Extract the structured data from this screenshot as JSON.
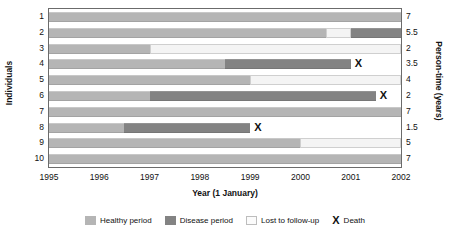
{
  "chart_data": {
    "type": "bar",
    "title": "",
    "xlabel": "Year (1 January)",
    "ylabel": "Individuals",
    "y2label": "Person-time (years)",
    "xlim": [
      1995,
      2002
    ],
    "xticks": [
      "1995",
      "1996",
      "1997",
      "1998",
      "1999",
      "2000",
      "2001",
      "2002"
    ],
    "categories": [
      "1",
      "2",
      "3",
      "4",
      "5",
      "6",
      "7",
      "8",
      "9",
      "10"
    ],
    "person_time": [
      "7",
      "5.5",
      "2",
      "3.5",
      "4",
      "2",
      "7",
      "1.5",
      "5",
      "7"
    ],
    "grid": false,
    "legend_position": "bottom",
    "series": [
      {
        "name": "Healthy period",
        "color": "#b5b5b5"
      },
      {
        "name": "Disease period",
        "color": "#838383"
      },
      {
        "name": "Lost to follow-up",
        "color": "#f4f4f4"
      },
      {
        "name": "Death",
        "color": "#111111"
      }
    ],
    "rows": [
      {
        "id": "1",
        "person_time": "7",
        "segments": [
          {
            "state": "healthy",
            "start": 1995,
            "end": 2002
          }
        ],
        "death": null
      },
      {
        "id": "2",
        "person_time": "5.5",
        "segments": [
          {
            "state": "healthy",
            "start": 1995,
            "end": 2000.5
          },
          {
            "state": "lost",
            "start": 2000.5,
            "end": 2001.0
          },
          {
            "state": "disease",
            "start": 2001.0,
            "end": 2002
          }
        ],
        "death": null
      },
      {
        "id": "3",
        "person_time": "2",
        "segments": [
          {
            "state": "healthy",
            "start": 1995,
            "end": 1997
          },
          {
            "state": "lost",
            "start": 1997,
            "end": 2002
          }
        ],
        "death": null
      },
      {
        "id": "4",
        "person_time": "3.5",
        "segments": [
          {
            "state": "healthy",
            "start": 1995,
            "end": 1998.5
          },
          {
            "state": "disease",
            "start": 1998.5,
            "end": 2001
          }
        ],
        "death": 2001
      },
      {
        "id": "5",
        "person_time": "4",
        "segments": [
          {
            "state": "healthy",
            "start": 1995,
            "end": 1999
          },
          {
            "state": "lost",
            "start": 1999,
            "end": 2002
          }
        ],
        "death": null
      },
      {
        "id": "6",
        "person_time": "2",
        "segments": [
          {
            "state": "healthy",
            "start": 1995,
            "end": 1997
          },
          {
            "state": "disease",
            "start": 1997,
            "end": 2001.5
          }
        ],
        "death": 2001.5
      },
      {
        "id": "7",
        "person_time": "7",
        "segments": [
          {
            "state": "healthy",
            "start": 1995,
            "end": 2002
          }
        ],
        "death": null
      },
      {
        "id": "8",
        "person_time": "1.5",
        "segments": [
          {
            "state": "healthy",
            "start": 1995,
            "end": 1996.5
          },
          {
            "state": "disease",
            "start": 1996.5,
            "end": 1999
          }
        ],
        "death": 1999
      },
      {
        "id": "9",
        "person_time": "5",
        "segments": [
          {
            "state": "healthy",
            "start": 1995,
            "end": 2000
          },
          {
            "state": "lost",
            "start": 2000,
            "end": 2002
          }
        ],
        "death": null
      },
      {
        "id": "10",
        "person_time": "7",
        "segments": [
          {
            "state": "healthy",
            "start": 1995,
            "end": 2002
          }
        ],
        "death": null
      }
    ]
  },
  "legend": {
    "items": [
      {
        "label": "Healthy period",
        "kind": "healthy"
      },
      {
        "label": "Disease period",
        "kind": "disease"
      },
      {
        "label": "Lost to follow-up",
        "kind": "lost"
      },
      {
        "label": "Death",
        "kind": "death",
        "glyph": "X"
      }
    ]
  },
  "axes": {
    "y_title": "Individuals",
    "y2_title": "Person-time (years)",
    "x_title": "Year (1 January)"
  }
}
